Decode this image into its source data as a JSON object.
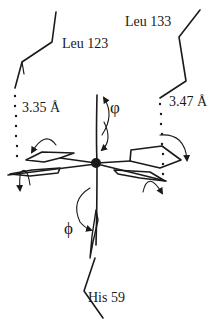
{
  "diagram": {
    "type": "molecular-geometry",
    "colors": {
      "ink": "#1a1a1a",
      "background": "#ffffff"
    },
    "residues": [
      {
        "id": "leu123",
        "label": "Leu 123"
      },
      {
        "id": "leu133",
        "label": "Leu 133"
      },
      {
        "id": "his59",
        "label": "His 59"
      }
    ],
    "distances": [
      {
        "id": "d1",
        "label": "3.35 Å",
        "between": "Leu 123 – ring"
      },
      {
        "id": "d2",
        "label": "3.47 Å",
        "between": "Leu 133 – ring"
      }
    ],
    "angles": [
      {
        "id": "varphi",
        "label": "φ"
      },
      {
        "id": "phi",
        "label": "ϕ"
      }
    ],
    "center": {
      "label": "metal-atom"
    }
  }
}
